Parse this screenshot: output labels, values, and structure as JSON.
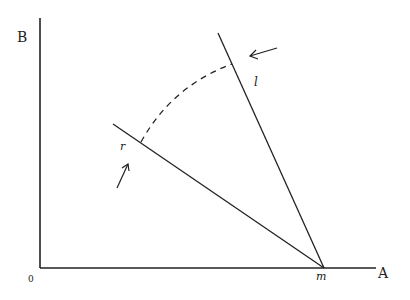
{
  "axes": {
    "y_label": "B",
    "x_label": "A",
    "origin_label": "0"
  },
  "points": {
    "vertex_label": "m"
  },
  "lines": {
    "l": {
      "label": "l"
    },
    "r": {
      "label": "r"
    }
  },
  "annotations": {
    "arc_style": "dashed",
    "arrows": [
      "arrow-toward-l",
      "arrow-toward-r"
    ]
  },
  "colors": {
    "stroke": "#222222",
    "background": "#ffffff"
  }
}
